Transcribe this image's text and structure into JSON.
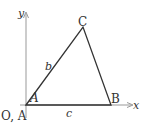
{
  "diagram": {
    "axes": {
      "x_label": "x",
      "y_label": "y"
    },
    "origin_label": "O, A",
    "vertices": {
      "A": "A",
      "B": "B",
      "C": "C"
    },
    "sides": {
      "b": "b",
      "c": "c"
    },
    "colors": {
      "axis": "#999999",
      "triangle": "#333333",
      "text": "#333333"
    }
  }
}
